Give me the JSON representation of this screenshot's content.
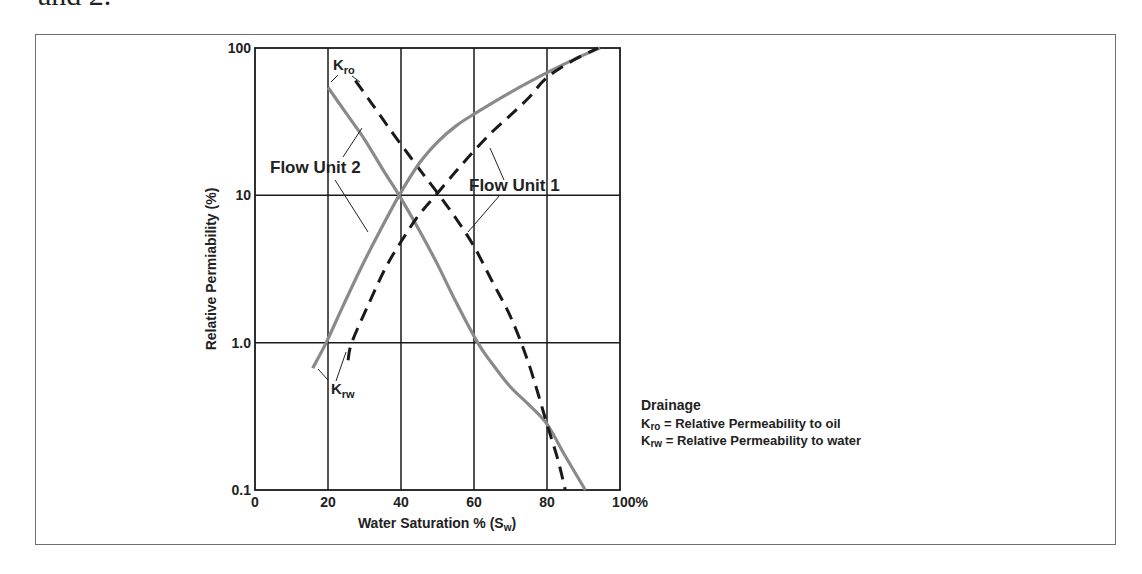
{
  "page": {
    "caption_fragment": "and 2."
  },
  "chart_data": {
    "type": "line",
    "title": "",
    "xlabel": "Water Saturation % (Sw)",
    "xlabel_main": "Water Saturation % (S",
    "xlabel_sub": "w",
    "xlabel_end": ")",
    "ylabel": "Relative Permiability (%)",
    "x_scale": "linear",
    "y_scale": "log",
    "xlim": [
      0,
      100
    ],
    "ylim": [
      0.1,
      100
    ],
    "x_ticks": [
      "0",
      "20",
      "40",
      "60",
      "80",
      "100%"
    ],
    "y_ticks": [
      "0.1",
      "1.0",
      "10",
      "100"
    ],
    "grid": true,
    "series": [
      {
        "name": "Flow Unit 2 Kro",
        "unit": "Flow Unit 2",
        "curve": "Kro",
        "style": "solid",
        "color": "#8a8a8a",
        "points": [
          [
            20,
            54
          ],
          [
            25,
            36
          ],
          [
            30,
            24
          ],
          [
            35,
            15
          ],
          [
            39.5,
            10
          ],
          [
            45,
            5.8
          ],
          [
            50,
            3.4
          ],
          [
            55,
            1.9
          ],
          [
            61,
            1.0
          ],
          [
            65,
            0.72
          ],
          [
            70,
            0.5
          ],
          [
            75,
            0.38
          ],
          [
            80,
            0.28
          ],
          [
            85,
            0.17
          ],
          [
            90.5,
            0.1
          ]
        ]
      },
      {
        "name": "Flow Unit 1 Kro",
        "unit": "Flow Unit 1",
        "curve": "Kro",
        "style": "dashed",
        "color": "#1a1a1a",
        "points": [
          [
            27.5,
            60
          ],
          [
            32,
            42
          ],
          [
            37,
            28
          ],
          [
            42,
            19
          ],
          [
            46,
            14
          ],
          [
            50.5,
            10
          ],
          [
            55,
            7
          ],
          [
            60,
            4.5
          ],
          [
            65,
            2.6
          ],
          [
            70,
            1.5
          ],
          [
            75,
            0.72
          ],
          [
            80,
            0.28
          ],
          [
            83,
            0.16
          ],
          [
            85,
            0.1
          ]
        ]
      },
      {
        "name": "Flow Unit 2 Krw",
        "unit": "Flow Unit 2",
        "curve": "Krw",
        "style": "solid",
        "color": "#8a8a8a",
        "points": [
          [
            15.8,
            0.67
          ],
          [
            19.5,
            1.0
          ],
          [
            24,
            1.75
          ],
          [
            29,
            3.2
          ],
          [
            34,
            5.6
          ],
          [
            39.5,
            10
          ],
          [
            45,
            16.5
          ],
          [
            50,
            23
          ],
          [
            55,
            29.5
          ],
          [
            60,
            35.6
          ],
          [
            70,
            50
          ],
          [
            80,
            68
          ],
          [
            88,
            85
          ],
          [
            94.5,
            100
          ]
        ]
      },
      {
        "name": "Flow Unit 1 Krw",
        "unit": "Flow Unit 1",
        "curve": "Krw",
        "style": "dashed",
        "color": "#1a1a1a",
        "points": [
          [
            25.5,
            0.76
          ],
          [
            26.5,
            1.0
          ],
          [
            31,
            1.8
          ],
          [
            36,
            3.3
          ],
          [
            41,
            5.3
          ],
          [
            45,
            7.4
          ],
          [
            49.5,
            10
          ],
          [
            55,
            14.5
          ],
          [
            60,
            20
          ],
          [
            65,
            27
          ],
          [
            70,
            35
          ],
          [
            75,
            46
          ],
          [
            80,
            63
          ],
          [
            87,
            82
          ],
          [
            94,
            100
          ]
        ]
      }
    ],
    "annotations": [
      {
        "text": "Flow Unit 2",
        "x": 270,
        "y": 173
      },
      {
        "text": "Flow Unit 1",
        "x": 469,
        "y": 191
      },
      {
        "text": "Kro",
        "main": "K",
        "sub": "ro",
        "x": 333,
        "y": 70
      },
      {
        "text": "Krw",
        "main": "K",
        "sub": "rw",
        "x": 331,
        "y": 394
      }
    ],
    "legend": {
      "title": "Drainage",
      "entries": [
        {
          "symbol_main": "K",
          "symbol_sub": "ro",
          "text": " = Relative Permeability to oil"
        },
        {
          "symbol_main": "K",
          "symbol_sub": "rw",
          "text": " = Relative Permeability to water"
        }
      ],
      "position": "lower-right, outside plot"
    }
  }
}
